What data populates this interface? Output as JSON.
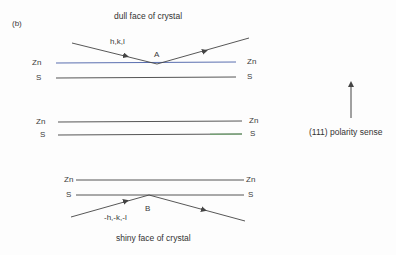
{
  "panel_label": "(b)",
  "top_caption": "dull face of crystal",
  "bottom_caption": "shiny face of crystal",
  "polarity_label": "(111) polarity sense",
  "points": {
    "a": "A",
    "b": "B"
  },
  "rays": {
    "incident_top": "h,k,l",
    "incident_bottom": "-h,-k,-l"
  },
  "layers": [
    {
      "name": "top",
      "zn": "Zn",
      "s": "S"
    },
    {
      "name": "middle",
      "zn": "Zn",
      "s": "S"
    },
    {
      "name": "bottom",
      "zn": "Zn",
      "s": "S"
    }
  ],
  "colors": {
    "zn_line_top": "#5a6fb0",
    "line": "#555555",
    "s_line_green_tint": "#6aa86a"
  }
}
